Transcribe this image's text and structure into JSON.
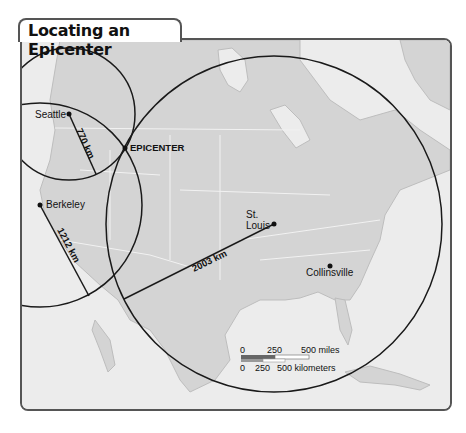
{
  "title": "Locating an Epicenter",
  "colors": {
    "land": "#d4d4d4",
    "water": "#ececec",
    "circle": "#1a1a1a",
    "frame": "#555555"
  },
  "stations": [
    {
      "name": "Seattle",
      "distance_label": "770 km"
    },
    {
      "name": "Berkeley",
      "distance_label": "1212 km"
    },
    {
      "name": "St. Louis",
      "distance_label": "2003 km"
    }
  ],
  "labels": {
    "epicenter": "EPICENTER",
    "seattle": "Seattle",
    "berkeley": "Berkeley",
    "st_louis_1": "St.",
    "st_louis_2": "Louis",
    "collinsville": "Collinsville",
    "seattle_km": "770 km",
    "berkeley_km": "1212 km",
    "stlouis_km": "2003 km"
  },
  "scale_bar": {
    "miles": {
      "ticks": [
        "0",
        "250",
        "500 miles"
      ]
    },
    "kilometers": {
      "ticks": [
        "0",
        "250",
        "500 kilometers"
      ]
    }
  }
}
